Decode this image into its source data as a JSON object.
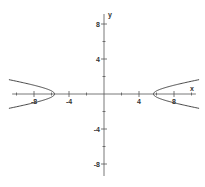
{
  "chart_data": {
    "type": "line",
    "title": "",
    "equation": "x^2/32 - y^2 = 1",
    "xlabel": "x",
    "ylabel": "y",
    "xlim": [
      -10.5,
      10.5
    ],
    "ylim": [
      -10.5,
      10.5
    ],
    "x_ticks": [
      -8,
      -4,
      4,
      8
    ],
    "y_ticks": [
      8,
      4,
      -4,
      -8
    ],
    "minor_tick_step": 2,
    "grid": false,
    "series": [
      {
        "name": "hyperbola-right-branch",
        "vertex": [
          5.66,
          0
        ],
        "points": [
          [
            10.5,
            1.56
          ],
          [
            8,
            1.0
          ],
          [
            6.5,
            0.57
          ],
          [
            5.66,
            0
          ],
          [
            6.5,
            -0.57
          ],
          [
            8,
            -1.0
          ],
          [
            10.5,
            -1.56
          ]
        ]
      },
      {
        "name": "hyperbola-left-branch",
        "vertex": [
          -5.66,
          0
        ],
        "points": [
          [
            -10.5,
            1.56
          ],
          [
            -8,
            1.0
          ],
          [
            -6.5,
            0.57
          ],
          [
            -5.66,
            0
          ],
          [
            -6.5,
            -0.57
          ],
          [
            -8,
            -1.0
          ],
          [
            -10.5,
            -1.56
          ]
        ]
      }
    ],
    "colors": {
      "axis": "#555555",
      "curve": "#333333"
    }
  }
}
